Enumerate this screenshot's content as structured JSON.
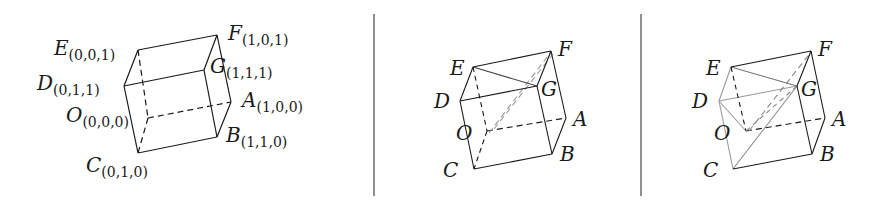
{
  "figure": {
    "panels": [
      {
        "id": "panel-1",
        "title": "Unit cube with labeled coordinates",
        "vertices": {
          "E": {
            "label": "E",
            "coord": "(0,0,1)"
          },
          "F": {
            "label": "F",
            "coord": "(1,0,1)"
          },
          "D": {
            "label": "D",
            "coord": "(0,1,1)"
          },
          "G": {
            "label": "G",
            "coord": "(1,1,1)"
          },
          "O": {
            "label": "O",
            "coord": "(0,0,0)"
          },
          "A": {
            "label": "A",
            "coord": "(1,0,0)"
          },
          "C": {
            "label": "C",
            "coord": "(0,1,0)"
          },
          "B": {
            "label": "B",
            "coord": "(1,1,0)"
          }
        }
      },
      {
        "id": "panel-2",
        "title": "Cube with triangle E-G and diagonal O-F",
        "vertices": {
          "E": {
            "label": "E"
          },
          "F": {
            "label": "F"
          },
          "D": {
            "label": "D"
          },
          "G": {
            "label": "G"
          },
          "O": {
            "label": "O"
          },
          "A": {
            "label": "A"
          },
          "C": {
            "label": "C"
          },
          "B": {
            "label": "B"
          }
        }
      },
      {
        "id": "panel-3",
        "title": "Cube with inscribed tetrahedron",
        "vertices": {
          "E": {
            "label": "E"
          },
          "F": {
            "label": "F"
          },
          "D": {
            "label": "D"
          },
          "G": {
            "label": "G"
          },
          "O": {
            "label": "O"
          },
          "A": {
            "label": "A"
          },
          "C": {
            "label": "C"
          },
          "B": {
            "label": "B"
          }
        }
      }
    ],
    "colors": {
      "ink": "#1a1a1a",
      "gray_edge": "#9a9a9a",
      "divider": "#555555"
    }
  }
}
